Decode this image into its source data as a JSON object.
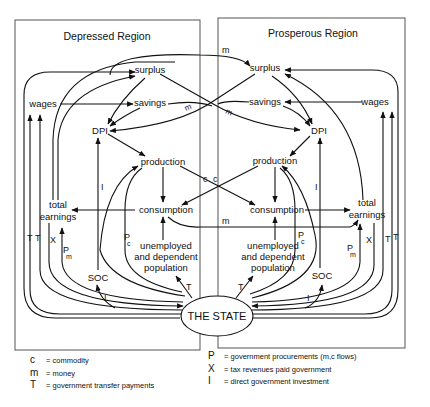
{
  "regions": {
    "left": {
      "title": "Depressed Region",
      "nodes": {
        "surplus": "surplus",
        "savings": "savings",
        "dpi": "DPI",
        "wages": "wages",
        "production": "production",
        "consumption": "consumption",
        "total_earnings_1": "total",
        "total_earnings_2": "earnings",
        "unemployed_1": "unemployed",
        "unemployed_2": "and dependent",
        "unemployed_3": "population",
        "soc": "SOC"
      },
      "flow_labels": {
        "T1": "T",
        "T2": "T",
        "X": "X",
        "Pm_P": "P",
        "Pm_sub": "m",
        "Pc_P": "P",
        "Pc_sub": "c",
        "I_dpi": "I",
        "I_soc": "I",
        "T_unemployed": "T",
        "m_savings": "m",
        "c_cross": "c"
      }
    },
    "right": {
      "title": "Prosperous Region",
      "nodes": {
        "surplus": "surplus",
        "savings": "savings",
        "dpi": "DPI",
        "wages": "wages",
        "production": "production",
        "consumption": "consumption",
        "total_earnings_1": "total",
        "total_earnings_2": "earnings",
        "unemployed_1": "unemployed",
        "unemployed_2": "and dependent",
        "unemployed_3": "population",
        "soc": "SOC"
      },
      "flow_labels": {
        "T1": "T",
        "T2": "T",
        "X": "X",
        "Pm_P": "P",
        "Pm_sub": "m",
        "Pc_P": "P",
        "Pc_sub": "c",
        "I_dpi": "I",
        "I_soc": "I",
        "T_unemployed": "T",
        "m_savings": "m",
        "c_cross": "c"
      }
    }
  },
  "center": {
    "state": "THE STATE",
    "m_surplus": "m",
    "m_consumption": "m"
  },
  "legend": {
    "left": [
      {
        "symbol": "c",
        "text": "= commodity"
      },
      {
        "symbol": "m",
        "text": "= money"
      },
      {
        "symbol": "T",
        "text": "= government transfer payments"
      }
    ],
    "right": [
      {
        "symbol": "P",
        "text": "= government procurements (m,c flows)"
      },
      {
        "symbol": "X",
        "text": "= tax revenues paid government"
      },
      {
        "symbol": "I",
        "text": "= direct government investment"
      }
    ]
  },
  "colors": {
    "ink": "#111111",
    "box": "#555555",
    "background": "#ffffff"
  }
}
